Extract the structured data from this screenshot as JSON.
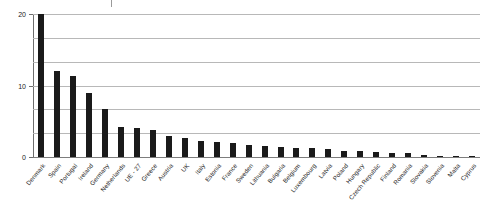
{
  "chart_data": {
    "type": "bar",
    "title": "",
    "subtitle": "",
    "xlabel": "",
    "ylabel": "",
    "ylim": [
      0,
      20
    ],
    "yticks": [
      0,
      10,
      20
    ],
    "ytick_labels": [
      "0",
      "10",
      "20"
    ],
    "gridlines": [
      3.33,
      6.67,
      10,
      13.33,
      16.67,
      20
    ],
    "grid": true,
    "legend": "none",
    "orientation": "vertical",
    "bar_color": "#1a1a1a",
    "categories": [
      "Denmark",
      "Spain",
      "Portugal",
      "Ireland",
      "Germany",
      "Netherlands",
      "UE - 27",
      "Greece",
      "Austria",
      "UK",
      "Italy",
      "Estonia",
      "France",
      "Sweden",
      "Lithuania",
      "Bulgaria",
      "Belgium",
      "Luxembourg",
      "Latvia",
      "Poland",
      "Hungary",
      "Czech Republic",
      "Finland",
      "Romania",
      "Slovakia",
      "Slovenia",
      "Malta",
      "Cyprus"
    ],
    "values": [
      20.0,
      12.1,
      11.4,
      9.0,
      6.7,
      4.2,
      4.1,
      3.8,
      3.0,
      2.6,
      2.3,
      2.1,
      1.9,
      1.7,
      1.5,
      1.4,
      1.3,
      1.2,
      1.1,
      0.9,
      0.8,
      0.7,
      0.6,
      0.5,
      0.25,
      0.2,
      0.15,
      0.1
    ],
    "series": [
      {
        "name": "",
        "values": [
          20.0,
          12.1,
          11.4,
          9.0,
          6.7,
          4.2,
          4.1,
          3.8,
          3.0,
          2.6,
          2.3,
          2.1,
          1.9,
          1.7,
          1.5,
          1.4,
          1.3,
          1.2,
          1.1,
          0.9,
          0.8,
          0.7,
          0.6,
          0.5,
          0.25,
          0.2,
          0.15,
          0.1
        ]
      }
    ]
  }
}
